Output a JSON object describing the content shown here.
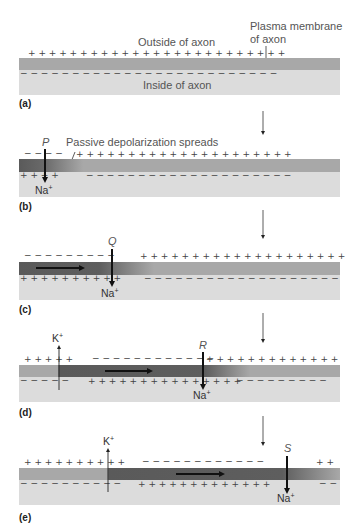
{
  "labels": {
    "outside": "Outside of axon",
    "inside": "Inside of axon",
    "membrane_line1": "Plasma membrane",
    "membrane_line2": "of axon",
    "passive": "Passive depolarization spreads"
  },
  "panels": [
    {
      "id": "a",
      "label": "(a)"
    },
    {
      "id": "b",
      "label": "(b)",
      "point": "P",
      "na": "Na+"
    },
    {
      "id": "c",
      "label": "(c)",
      "point": "Q",
      "na": "Na+"
    },
    {
      "id": "d",
      "label": "(d)",
      "point": "R",
      "na": "Na+",
      "k": "K+"
    },
    {
      "id": "e",
      "label": "(e)",
      "point": "S",
      "na": "Na+",
      "k": "K+"
    }
  ],
  "colors": {
    "membrane": "#a8a8a8",
    "depolarized": "#5a5a5a",
    "inside": "#dcdcdc",
    "arrow": "#111111"
  }
}
